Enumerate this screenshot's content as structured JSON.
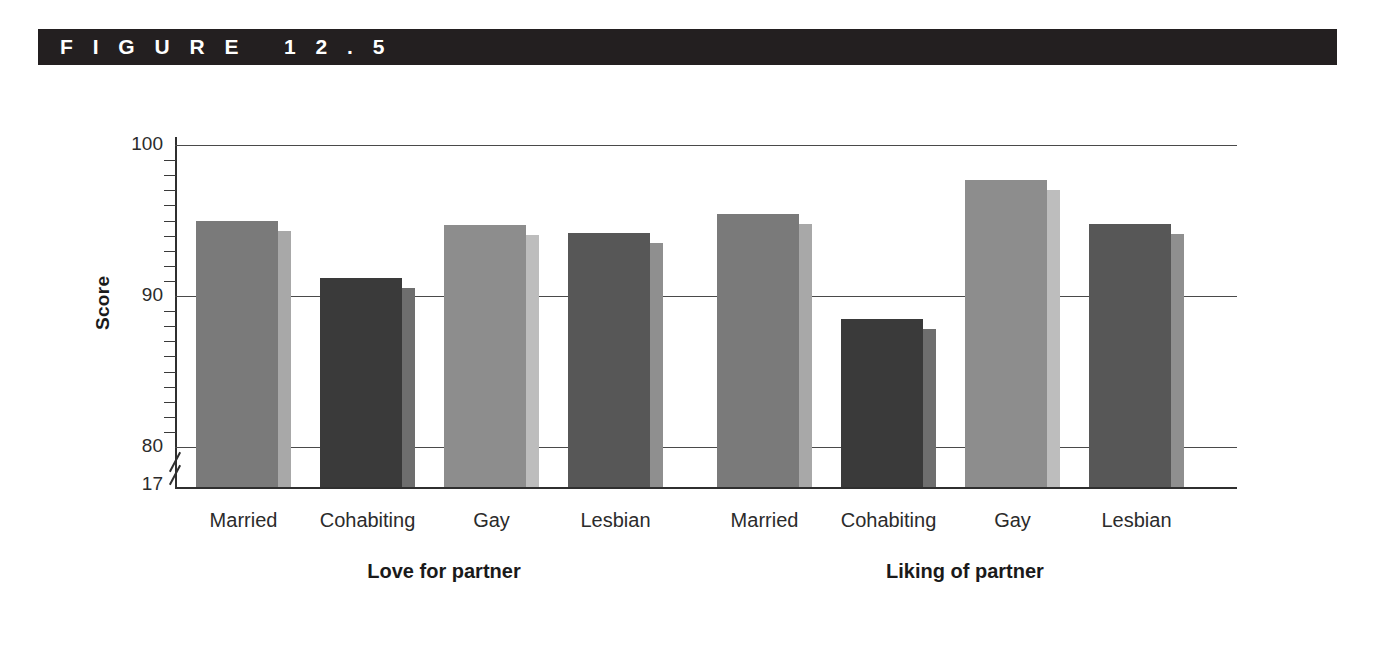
{
  "figure": {
    "label": "F I G U R E   1 2 . 5"
  },
  "axes": {
    "y_axis_title": "Score",
    "y_ticks": [
      "100",
      "90",
      "80",
      "17"
    ],
    "y_major_values": [
      100,
      90,
      80
    ],
    "y_base_label": "17",
    "has_axis_break": true,
    "gridlines_visible": true
  },
  "groups": [
    {
      "label": "Love for partner"
    },
    {
      "label": "Liking of partner"
    }
  ],
  "category_labels": [
    "Married",
    "Cohabiting",
    "Gay",
    "Lesbian"
  ],
  "colors": {
    "title_bar": "#231f20",
    "page_background": "#ffffff",
    "axis": "#2f2f2f",
    "gridline": "#4a4a4a",
    "bar_medium_gray": "#7a7a7a",
    "bar_dark_gray": "#3a3a3a",
    "bar_light_gray": "#8d8d8d",
    "bar_darker_gray": "#575757",
    "bar_side_light": "#b0b0b0",
    "bar_side_medium": "#8a8a8a",
    "bar_side_dark": "#6e6e6e"
  },
  "chart_data": {
    "type": "bar",
    "title": "F I G U R E   1 2 . 5",
    "xlabel": "",
    "ylabel": "Score",
    "ylim": [
      80,
      100
    ],
    "y_baseline_label": "17",
    "axis_break": true,
    "grid": true,
    "legend_position": "none",
    "categories": [
      "Married",
      "Cohabiting",
      "Gay",
      "Lesbian"
    ],
    "groups": [
      "Love for partner",
      "Liking of partner"
    ],
    "series": [
      {
        "name": "Love for partner",
        "values": [
          95.0,
          91.2,
          94.7,
          94.2
        ]
      },
      {
        "name": "Liking of partner",
        "values": [
          95.4,
          88.5,
          97.7,
          94.8
        ]
      }
    ],
    "bars": [
      {
        "group": "Love for partner",
        "category": "Married",
        "value": 95.0,
        "color": "#7a7a7a"
      },
      {
        "group": "Love for partner",
        "category": "Cohabiting",
        "value": 91.2,
        "color": "#3a3a3a"
      },
      {
        "group": "Love for partner",
        "category": "Gay",
        "value": 94.7,
        "color": "#8d8d8d"
      },
      {
        "group": "Love for partner",
        "category": "Lesbian",
        "value": 94.2,
        "color": "#575757"
      },
      {
        "group": "Liking of partner",
        "category": "Married",
        "value": 95.4,
        "color": "#7a7a7a"
      },
      {
        "group": "Liking of partner",
        "category": "Cohabiting",
        "value": 88.5,
        "color": "#3a3a3a"
      },
      {
        "group": "Liking of partner",
        "category": "Gay",
        "value": 97.7,
        "color": "#8d8d8d"
      },
      {
        "group": "Liking of partner",
        "category": "Lesbian",
        "value": 94.8,
        "color": "#575757"
      }
    ],
    "yticks": [
      80,
      90,
      100
    ],
    "minor_tick_interval": 1
  }
}
